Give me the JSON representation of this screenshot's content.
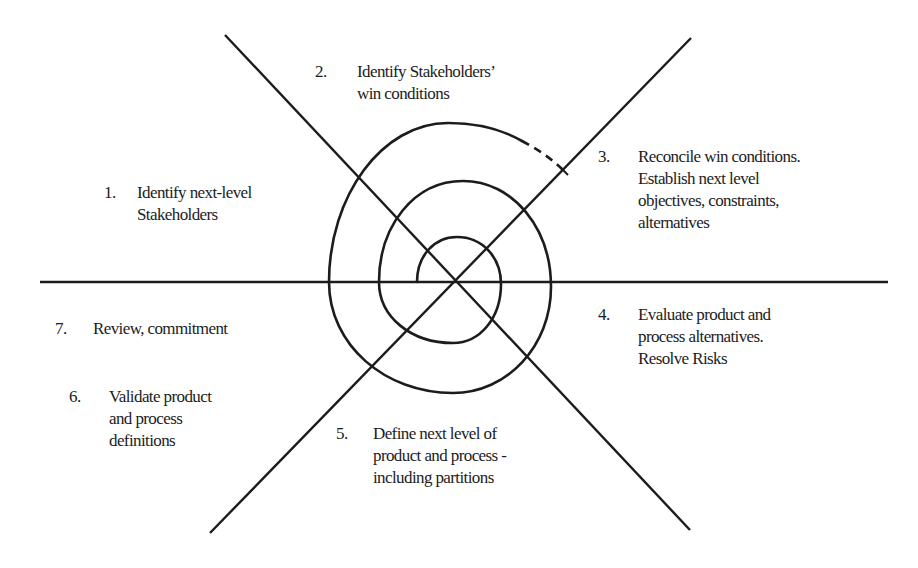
{
  "diagram": {
    "type": "WinWin spiral model",
    "center": [
      453,
      282
    ],
    "line_color": "#1c1c1c",
    "background": "#ffffff",
    "steps": [
      {
        "number": "1.",
        "lines": [
          "Identify next-level",
          "Stakeholders"
        ]
      },
      {
        "number": "2.",
        "lines": [
          "Identify Stakeholders’",
          "win conditions"
        ]
      },
      {
        "number": "3.",
        "lines": [
          "Reconcile win conditions.",
          "Establish next level",
          "objectives, constraints,",
          "alternatives"
        ]
      },
      {
        "number": "4.",
        "lines": [
          "Evaluate product and",
          "process alternatives.",
          "Resolve Risks"
        ]
      },
      {
        "number": "5.",
        "lines": [
          "Define next level of",
          "product and process -",
          "including partitions"
        ]
      },
      {
        "number": "6.",
        "lines": [
          "Validate product",
          "and process",
          "definitions"
        ]
      },
      {
        "number": "7.",
        "lines": [
          "Review, commitment"
        ]
      }
    ]
  }
}
